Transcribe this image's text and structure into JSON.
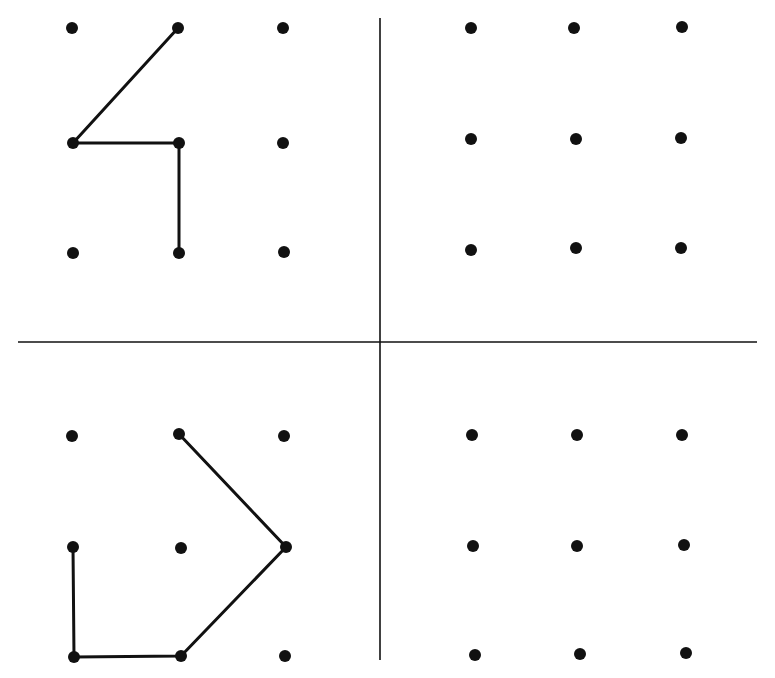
{
  "diagram": {
    "type": "dot-grid-puzzle",
    "width": 775,
    "height": 678,
    "colors": {
      "background": "#ffffff",
      "ink": "#111111"
    },
    "dividers": [
      {
        "name": "vertical-divider",
        "x1": 380,
        "y1": 18,
        "x2": 380,
        "y2": 660
      },
      {
        "name": "horizontal-divider",
        "x1": 18,
        "y1": 342,
        "x2": 757,
        "y2": 342
      }
    ],
    "quadrants": [
      {
        "name": "top-left",
        "dots": [
          [
            72,
            28
          ],
          [
            178,
            28
          ],
          [
            283,
            28
          ],
          [
            73,
            143
          ],
          [
            179,
            143
          ],
          [
            283,
            143
          ],
          [
            73,
            253
          ],
          [
            179,
            253
          ],
          [
            284,
            252
          ]
        ],
        "path": [
          [
            178,
            28
          ],
          [
            73,
            143
          ],
          [
            179,
            143
          ],
          [
            179,
            253
          ]
        ],
        "description": "Figure resembling the digit 4"
      },
      {
        "name": "top-right",
        "dots": [
          [
            471,
            28
          ],
          [
            574,
            28
          ],
          [
            682,
            27
          ],
          [
            471,
            139
          ],
          [
            576,
            139
          ],
          [
            681,
            138
          ],
          [
            471,
            250
          ],
          [
            576,
            248
          ],
          [
            681,
            248
          ]
        ],
        "path": [],
        "description": "Empty grid"
      },
      {
        "name": "bottom-left",
        "dots": [
          [
            72,
            436
          ],
          [
            179,
            434
          ],
          [
            284,
            436
          ],
          [
            73,
            547
          ],
          [
            181,
            548
          ],
          [
            286,
            547
          ],
          [
            74,
            657
          ],
          [
            181,
            656
          ],
          [
            285,
            656
          ]
        ],
        "path": [
          [
            73,
            547
          ],
          [
            74,
            657
          ],
          [
            181,
            656
          ],
          [
            286,
            547
          ],
          [
            179,
            434
          ]
        ],
        "description": "Open pentagon-like path"
      },
      {
        "name": "bottom-right",
        "dots": [
          [
            472,
            435
          ],
          [
            577,
            435
          ],
          [
            682,
            435
          ],
          [
            473,
            546
          ],
          [
            577,
            546
          ],
          [
            684,
            545
          ],
          [
            475,
            655
          ],
          [
            580,
            654
          ],
          [
            686,
            653
          ]
        ],
        "path": [],
        "description": "Empty grid"
      }
    ]
  }
}
